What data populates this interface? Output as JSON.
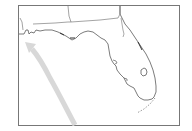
{
  "map": {
    "region": "Florida",
    "features": [
      "state-borders",
      "coastline",
      "lake-okeechobee",
      "storm-track-arrow"
    ],
    "colors": {
      "background": "#ffffff",
      "frame": "#777777",
      "coastline": "#444444",
      "border": "#666666",
      "track_arrow": "#d6d6d6"
    }
  }
}
